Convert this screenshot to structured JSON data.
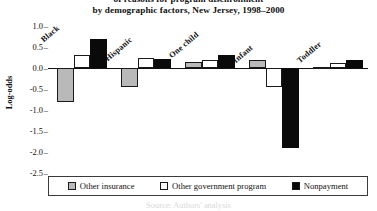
{
  "chart_data": {
    "type": "bar",
    "subtitle": "by demographic factors, New Jersey, 1998–2000",
    "title_lines": [
      "of reasons for program disenrollment",
      "by demographic factors, New Jersey, 1998–2000"
    ],
    "xlabel": "",
    "ylabel": "Log-odds",
    "ylim": [
      -2.5,
      1.25
    ],
    "yticks": [
      1.0,
      0.5,
      0.0,
      -0.5,
      -1.0,
      -1.5,
      -2.0,
      -2.5
    ],
    "ytick_labels": [
      "1.0",
      "0.5",
      "0.0",
      "-0.5",
      "-1.0",
      "-1.5",
      "-2.0",
      "-2.5"
    ],
    "grid": false,
    "legend_position": "bottom",
    "zero_line": true,
    "categories": [
      "Black",
      "Hispanic",
      "One child",
      "Infant",
      "Toddler"
    ],
    "series": [
      {
        "name": "Other insurance",
        "color": "#b9b9b9",
        "values": [
          -0.8,
          -0.45,
          0.15,
          0.2,
          0.03
        ]
      },
      {
        "name": "Other government program",
        "color": "#ffffff",
        "values": [
          0.3,
          0.25,
          0.2,
          -0.45,
          0.12
        ]
      },
      {
        "name": "Nonpayment",
        "color": "#0a0a0a",
        "values": [
          0.7,
          0.22,
          0.32,
          -1.9,
          0.18
        ]
      }
    ]
  },
  "legend": {
    "items": [
      {
        "label": "Other insurance"
      },
      {
        "label": "Other government program"
      },
      {
        "label": "Nonpayment"
      }
    ]
  },
  "footer": {
    "note": "Source: Authors' analysis"
  }
}
